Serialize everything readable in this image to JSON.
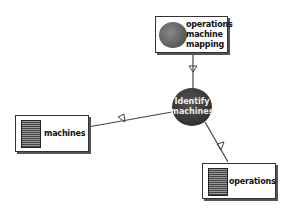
{
  "diagram": {
    "center_node": {
      "line1": "Identify",
      "line2": "machines"
    },
    "top_node": {
      "lines": [
        "operations",
        "machine",
        "mapping"
      ],
      "icon": "blob-icon"
    },
    "left_node": {
      "label": "machines",
      "icon": "document-icon"
    },
    "right_node": {
      "label": "operations",
      "icon": "document-icon"
    },
    "edges": [
      {
        "from": "top_node",
        "to": "center_node",
        "arrow": "open-triangle"
      },
      {
        "from": "center_node",
        "to": "left_node",
        "arrow": "open-triangle"
      },
      {
        "from": "center_node",
        "to": "right_node",
        "arrow": "open-triangle"
      }
    ]
  }
}
